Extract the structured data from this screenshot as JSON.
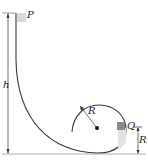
{
  "diagram": {
    "type": "loop-the-loop track",
    "labels": {
      "start_point": "P",
      "height": "h",
      "loop_radius": "R",
      "point_on_loop": "Q",
      "q_height": "R"
    },
    "colors": {
      "track": "#3a3a3a",
      "block": "#8a8a8a",
      "shade": "#dcdcdc",
      "dimension": "#333333"
    }
  }
}
